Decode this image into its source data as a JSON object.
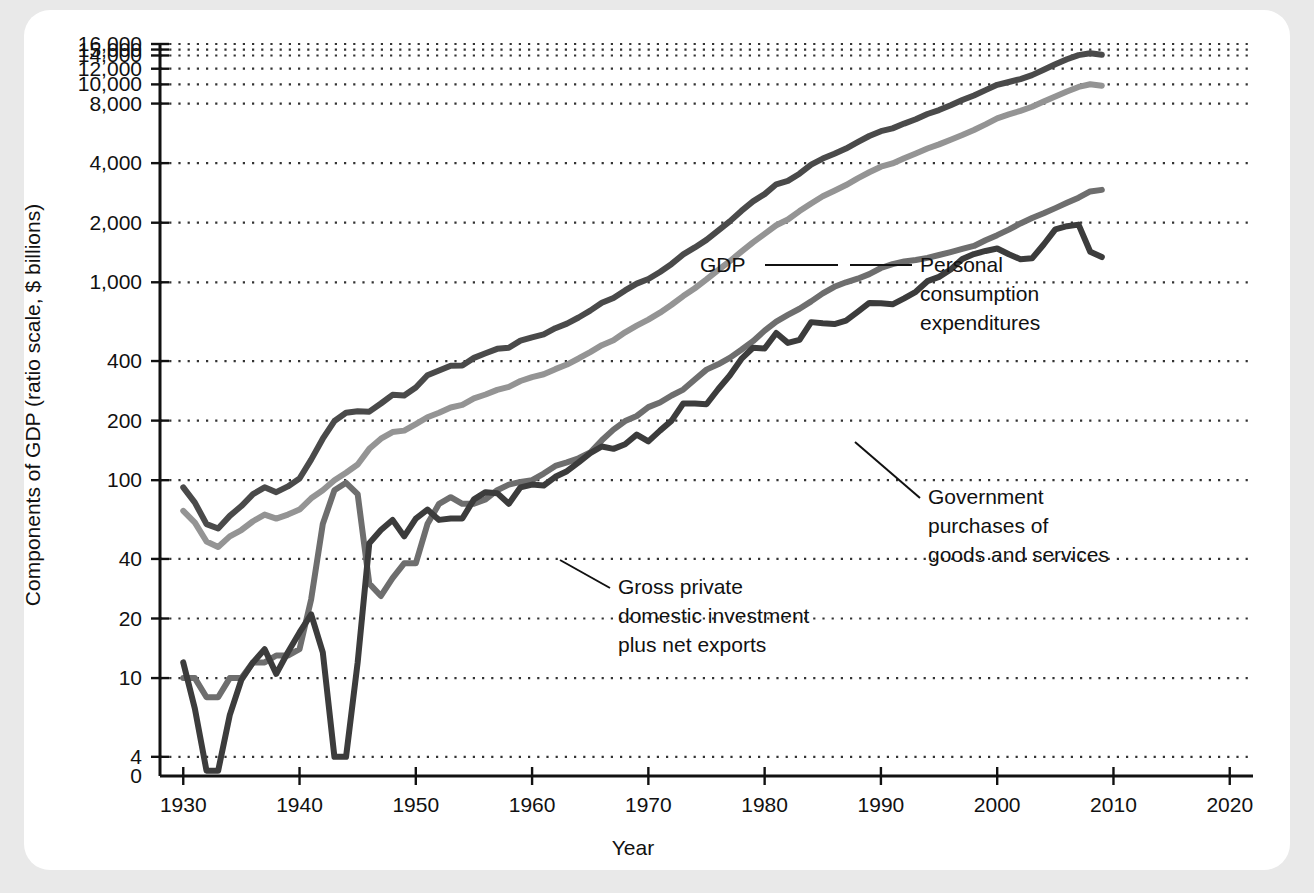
{
  "figure": {
    "background_color": "#e9e9e9",
    "card_color": "#ffffff"
  },
  "chart_data": {
    "type": "line",
    "title": "",
    "subtitle": "",
    "xlabel": "Year",
    "ylabel": "Components of GDP (ratio scale, $ billions)",
    "scale": "log",
    "grid": true,
    "grid_style": "dotted-horizontal",
    "legend_position": "inline-annotations",
    "xlim": [
      1928,
      2022
    ],
    "ylim": [
      3.2,
      17000
    ],
    "xticks": [
      "1930",
      "1940",
      "1950",
      "1960",
      "1970",
      "1980",
      "1990",
      "2000",
      "2010",
      "2020"
    ],
    "xtick_values": [
      1930,
      1940,
      1950,
      1960,
      1970,
      1980,
      1990,
      2000,
      2010,
      2020
    ],
    "yticks": [
      "0",
      "4",
      "10",
      "20",
      "40",
      "100",
      "200",
      "400",
      "1,000",
      "2,000",
      "4,000",
      "8,000",
      "10,000",
      "12,000",
      "14,000",
      "15,000",
      "16,000"
    ],
    "ytick_values": [
      0,
      4,
      10,
      20,
      40,
      100,
      200,
      400,
      1000,
      2000,
      4000,
      8000,
      10000,
      12000,
      14000,
      15000,
      16000
    ],
    "colors": {
      "gdp": "#4a4a4a",
      "pce": "#949494",
      "government": "#6e6e6e",
      "investment": "#3c3c3c",
      "axis": "#111111",
      "grid": "#333333"
    },
    "series": [
      {
        "name": "GDP",
        "color": "#4a4a4a",
        "x": [
          1930,
          1931,
          1932,
          1933,
          1934,
          1935,
          1936,
          1937,
          1938,
          1939,
          1940,
          1941,
          1942,
          1943,
          1944,
          1945,
          1946,
          1947,
          1948,
          1949,
          1950,
          1951,
          1952,
          1953,
          1954,
          1955,
          1956,
          1957,
          1958,
          1959,
          1960,
          1961,
          1962,
          1963,
          1964,
          1965,
          1966,
          1967,
          1968,
          1969,
          1970,
          1971,
          1972,
          1973,
          1974,
          1975,
          1976,
          1977,
          1978,
          1979,
          1980,
          1981,
          1982,
          1983,
          1984,
          1985,
          1986,
          1987,
          1988,
          1989,
          1990,
          1991,
          1992,
          1993,
          1994,
          1995,
          1996,
          1997,
          1998,
          1999,
          2000,
          2001,
          2002,
          2003,
          2004,
          2005,
          2006,
          2007,
          2008,
          2009
        ],
        "values": [
          92,
          77,
          60,
          57,
          66,
          74,
          85,
          92,
          87,
          93,
          102,
          127,
          162,
          199,
          219,
          223,
          222,
          244,
          270,
          268,
          294,
          339,
          358,
          379,
          380,
          415,
          438,
          461,
          467,
          507,
          527,
          545,
          586,
          618,
          664,
          719,
          788,
          833,
          910,
          985,
          1039,
          1127,
          1238,
          1383,
          1500,
          1638,
          1825,
          2031,
          2294,
          2563,
          2790,
          3128,
          3255,
          3537,
          3933,
          4220,
          4463,
          4740,
          5104,
          5484,
          5803,
          5996,
          6338,
          6667,
          7085,
          7415,
          7839,
          8332,
          8794,
          9354,
          9952,
          10286,
          10642,
          11142,
          11868,
          12638,
          13399,
          14062,
          14369,
          14119
        ]
      },
      {
        "name": "Personal consumption expenditures",
        "color": "#949494",
        "x": [
          1930,
          1931,
          1932,
          1933,
          1934,
          1935,
          1936,
          1937,
          1938,
          1939,
          1940,
          1941,
          1942,
          1943,
          1944,
          1945,
          1946,
          1947,
          1948,
          1949,
          1950,
          1951,
          1952,
          1953,
          1954,
          1955,
          1956,
          1957,
          1958,
          1959,
          1960,
          1961,
          1962,
          1963,
          1964,
          1965,
          1966,
          1967,
          1968,
          1969,
          1970,
          1971,
          1972,
          1973,
          1974,
          1975,
          1976,
          1977,
          1978,
          1979,
          1980,
          1981,
          1982,
          1983,
          1984,
          1985,
          1986,
          1987,
          1988,
          1989,
          1990,
          1991,
          1992,
          1993,
          1994,
          1995,
          1996,
          1997,
          1998,
          1999,
          2000,
          2001,
          2002,
          2003,
          2004,
          2005,
          2006,
          2007,
          2008,
          2009
        ],
        "values": [
          70,
          61,
          49,
          46,
          52,
          56,
          62,
          67,
          64,
          67,
          71,
          81,
          89,
          100,
          109,
          120,
          144,
          162,
          175,
          178,
          192,
          208,
          219,
          233,
          240,
          259,
          271,
          286,
          296,
          317,
          332,
          343,
          364,
          384,
          412,
          444,
          481,
          509,
          559,
          604,
          648,
          702,
          770,
          852,
          933,
          1034,
          1152,
          1278,
          1428,
          1592,
          1757,
          1941,
          2077,
          2290,
          2503,
          2720,
          2899,
          3100,
          3353,
          3598,
          3839,
          3986,
          4235,
          4477,
          4743,
          4976,
          5257,
          5547,
          5879,
          6282,
          6739,
          7055,
          7351,
          7709,
          8196,
          8694,
          9207,
          9710,
          10012,
          9847
        ]
      },
      {
        "name": "Government purchases of goods and services",
        "color": "#6e6e6e",
        "x": [
          1930,
          1931,
          1932,
          1933,
          1934,
          1935,
          1936,
          1937,
          1938,
          1939,
          1940,
          1941,
          1942,
          1943,
          1944,
          1945,
          1946,
          1947,
          1948,
          1949,
          1950,
          1951,
          1952,
          1953,
          1954,
          1955,
          1956,
          1957,
          1958,
          1959,
          1960,
          1961,
          1962,
          1963,
          1964,
          1965,
          1966,
          1967,
          1968,
          1969,
          1970,
          1971,
          1972,
          1973,
          1974,
          1975,
          1976,
          1977,
          1978,
          1979,
          1980,
          1981,
          1982,
          1983,
          1984,
          1985,
          1986,
          1987,
          1988,
          1989,
          1990,
          1991,
          1992,
          1993,
          1994,
          1995,
          1996,
          1997,
          1998,
          1999,
          2000,
          2001,
          2002,
          2003,
          2004,
          2005,
          2006,
          2007,
          2008,
          2009
        ],
        "values": [
          10,
          10,
          8,
          8,
          10,
          10,
          12,
          12,
          13,
          13,
          14,
          25,
          60,
          89,
          97,
          85,
          30,
          26,
          32,
          38,
          38,
          60,
          76,
          82,
          76,
          76,
          80,
          89,
          95,
          98,
          100,
          108,
          118,
          123,
          129,
          138,
          159,
          180,
          199,
          211,
          234,
          247,
          268,
          287,
          323,
          362,
          385,
          415,
          456,
          504,
          570,
          633,
          684,
          735,
          801,
          879,
          949,
          1000,
          1043,
          1100,
          1181,
          1236,
          1273,
          1295,
          1329,
          1374,
          1421,
          1474,
          1526,
          1632,
          1731,
          1846,
          1983,
          2112,
          2233,
          2370,
          2520,
          2675,
          2878,
          2931
        ]
      },
      {
        "name": "Gross private domestic investment plus net exports",
        "color": "#3c3c3c",
        "x": [
          1930,
          1931,
          1932,
          1933,
          1934,
          1935,
          1936,
          1937,
          1938,
          1939,
          1940,
          1941,
          1942,
          1943,
          1944,
          1945,
          1946,
          1947,
          1948,
          1949,
          1950,
          1951,
          1952,
          1953,
          1954,
          1955,
          1956,
          1957,
          1958,
          1959,
          1960,
          1961,
          1962,
          1963,
          1964,
          1965,
          1966,
          1967,
          1968,
          1969,
          1970,
          1971,
          1972,
          1973,
          1974,
          1975,
          1976,
          1977,
          1978,
          1979,
          1980,
          1981,
          1982,
          1983,
          1984,
          1985,
          1986,
          1987,
          1988,
          1989,
          1990,
          1991,
          1992,
          1993,
          1994,
          1995,
          1996,
          1997,
          1998,
          1999,
          2000,
          2001,
          2002,
          2003,
          2004,
          2005,
          2006,
          2007,
          2008,
          2009
        ],
        "values": [
          12,
          7,
          3.4,
          3.4,
          6.5,
          9.8,
          12,
          14,
          10.5,
          13.5,
          17,
          21,
          13.5,
          4,
          4,
          12,
          48,
          56,
          63,
          52,
          64,
          71,
          63,
          64,
          64,
          80,
          87,
          86,
          76,
          92,
          95,
          94,
          104,
          111,
          123,
          137,
          148,
          144,
          152,
          170,
          157,
          178,
          200,
          244,
          244,
          242,
          288,
          338,
          410,
          467,
          463,
          554,
          494,
          512,
          629,
          621,
          615,
          640,
          708,
          786,
          783,
          774,
          830,
          895,
          1013,
          1065,
          1161,
          1311,
          1389,
          1440,
          1482,
          1385,
          1308,
          1321,
          1552,
          1851,
          1920,
          1956,
          1426,
          1341
        ]
      }
    ],
    "annotations": [
      {
        "id": "gdp",
        "label": "GDP",
        "lines": [
          "GDP"
        ],
        "anchor_x": 1973,
        "anchor_y": 1550
      },
      {
        "id": "pce",
        "label": "Personal consumption expenditures",
        "lines": [
          "Personal",
          "consumption",
          "expenditures"
        ],
        "anchor_x": 1984,
        "anchor_y": 2600
      },
      {
        "id": "government",
        "label": "Government purchases of goods and services",
        "lines": [
          "Government",
          "purchases of",
          "goods and services"
        ],
        "anchor_x": 1981,
        "anchor_y": 660
      },
      {
        "id": "investment",
        "label": "Gross private domestic investment plus net exports",
        "lines": [
          "Gross private",
          "domestic investment",
          "plus net exports"
        ],
        "anchor_x": 1968,
        "anchor_y": 155
      }
    ]
  }
}
